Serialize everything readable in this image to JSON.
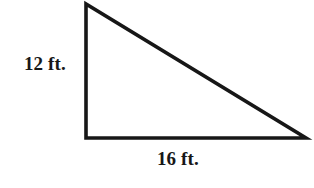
{
  "figure": {
    "kind": "right-triangle",
    "background_color": "#ffffff",
    "stroke_color": "#171717",
    "stroke_width": 3.6,
    "fill_color": "none",
    "vertices": {
      "apex": {
        "x": 86,
        "y": 4
      },
      "right_angle": {
        "x": 86,
        "y": 138
      },
      "base_right": {
        "x": 306,
        "y": 138
      }
    },
    "labels": {
      "vertical_leg": "12 ft.",
      "horizontal_leg": "16 ft."
    },
    "label_color": "#171717"
  },
  "chart_data": {
    "type": "diagram",
    "title": "",
    "shape": "right triangle",
    "measurements": [
      {
        "side": "vertical leg (height)",
        "value": 12,
        "unit": "ft.",
        "label": "12 ft."
      },
      {
        "side": "horizontal leg (base)",
        "value": 16,
        "unit": "ft.",
        "label": "16 ft."
      }
    ],
    "annotations": [
      "12 ft.",
      "16 ft."
    ]
  }
}
